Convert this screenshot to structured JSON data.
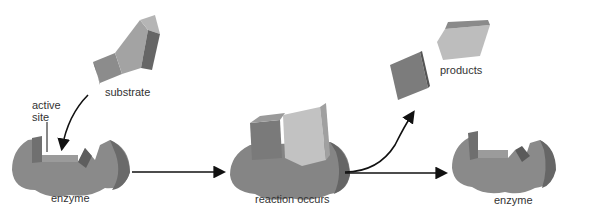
{
  "stages": [
    {
      "id": "enzyme-initial",
      "label": "enzyme"
    },
    {
      "id": "complex",
      "label": "reaction occurs"
    },
    {
      "id": "enzyme-final",
      "label": "enzyme"
    }
  ],
  "labels": {
    "substrate": "substrate",
    "active_site_line1": "active",
    "active_site_line2": "site",
    "products": "products",
    "enzyme_left": "enzyme",
    "reaction": "reaction occurs",
    "enzyme_right": "enzyme"
  },
  "colors": {
    "enzyme_face": "#8a8a8a",
    "enzyme_side": "#6e6e6e",
    "enzyme_top": "#9a9a9a",
    "substrate_dark": "#7d7d7d",
    "substrate_light": "#b9b9b9",
    "arrow": "#111111",
    "text": "#333333"
  }
}
